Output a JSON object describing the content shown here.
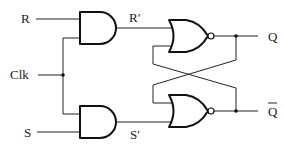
{
  "diagram": {
    "type": "circuit",
    "inputs": [
      {
        "id": "R",
        "label": "R"
      },
      {
        "id": "Clk",
        "label": "Clk"
      },
      {
        "id": "S",
        "label": "S"
      }
    ],
    "internal_signals": [
      {
        "id": "Rp",
        "label": "R′"
      },
      {
        "id": "Sp",
        "label": "S′"
      }
    ],
    "outputs": [
      {
        "id": "Q",
        "label": "Q"
      },
      {
        "id": "Qbar",
        "label": "Q",
        "overbar": true
      }
    ],
    "gates": [
      {
        "id": "and-top",
        "type": "AND",
        "inputs": [
          "R",
          "Clk"
        ],
        "output": "R′"
      },
      {
        "id": "and-bottom",
        "type": "AND",
        "inputs": [
          "Clk",
          "S"
        ],
        "output": "S′"
      },
      {
        "id": "nor-top",
        "type": "NOR",
        "inputs": [
          "R′",
          "Q̄"
        ],
        "output": "Q"
      },
      {
        "id": "nor-bottom",
        "type": "NOR",
        "inputs": [
          "Q",
          "S′"
        ],
        "output": "Q̄"
      }
    ],
    "colors": {
      "line": "#222222",
      "background": "#ffffff"
    }
  }
}
